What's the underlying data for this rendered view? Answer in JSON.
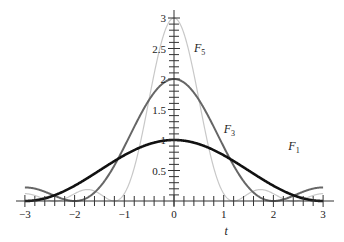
{
  "chart_data": {
    "type": "line",
    "title": "",
    "xlabel": "t",
    "ylabel": "",
    "xlim": [
      -3,
      3
    ],
    "ylim": [
      0,
      3
    ],
    "grid": false,
    "legend": "inline labels",
    "x_ticks": [
      "-3",
      "-2",
      "-1",
      "0",
      "1",
      "2",
      "3"
    ],
    "y_ticks": [
      "0.5",
      "1",
      "1.5",
      "2",
      "2.5",
      "3"
    ],
    "series": [
      {
        "name": "F1",
        "label": "F",
        "subscript": "1",
        "color": "#111111",
        "width": 2.6,
        "peak": 1.0,
        "n": 1
      },
      {
        "name": "F3",
        "label": "F",
        "subscript": "3",
        "color": "#666666",
        "width": 2.0,
        "peak": 2.0,
        "n": 3
      },
      {
        "name": "F5",
        "label": "F",
        "subscript": "5",
        "color": "#c8c8c8",
        "width": 1.2,
        "peak": 3.0,
        "n": 5
      }
    ],
    "annotations": [
      {
        "text": "F5",
        "t": 0.4,
        "y": 2.45
      },
      {
        "text": "F3",
        "t": 1.0,
        "y": 1.12
      },
      {
        "text": "F1",
        "t": 2.3,
        "y": 0.83
      }
    ]
  }
}
